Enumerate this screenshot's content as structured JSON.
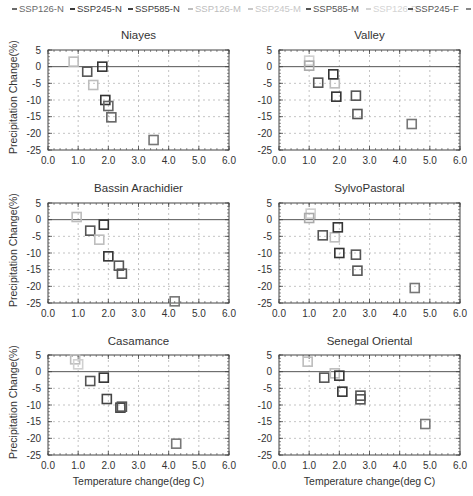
{
  "legend": [
    {
      "label": "SSP126-N",
      "color": "#6a6a6a",
      "x": 12
    },
    {
      "label": "SSP245-N",
      "color": "#3a3a3a",
      "x": 70
    },
    {
      "label": "SSP585-N",
      "color": "#404040",
      "x": 128
    },
    {
      "label": "SSP126-M",
      "color": "#bdbdbd",
      "x": 188
    },
    {
      "label": "SSP245-M",
      "color": "#c8c8c8",
      "x": 248
    },
    {
      "label": "SSP585-M",
      "color": "#555555",
      "x": 306
    },
    {
      "label": "SSP126-F",
      "color": "#d4d4d4",
      "x": 366
    },
    {
      "label": "SSP245-F",
      "color": "#555555",
      "x": 408
    },
    {
      "label": "",
      "color": "#888888",
      "x": 466
    }
  ],
  "axes": {
    "xlabel": "Temperature change(deg C)",
    "ylabel": "Precipitation Change(%)",
    "xticks": [
      "0.0",
      "1.0",
      "2.0",
      "3.0",
      "4.0",
      "5.0",
      "6.0"
    ],
    "yticks": [
      "5",
      "0",
      "-5",
      "-10",
      "-15",
      "-20",
      "-25"
    ]
  },
  "chart_data": [
    {
      "type": "scatter",
      "title": "Niayes",
      "xlabel": "",
      "ylabel": "Precipitation Change(%)",
      "xlim": [
        0,
        6
      ],
      "ylim": [
        -25,
        5
      ],
      "grid": true,
      "legend_position": "top",
      "points": [
        {
          "series": "SSP126-M",
          "x": 0.85,
          "y": 1.5,
          "color": "#bdbdbd"
        },
        {
          "series": "SSP126-N",
          "x": 1.3,
          "y": -1.5,
          "color": "#555555"
        },
        {
          "series": "SSP245-M",
          "x": 1.5,
          "y": -5.5,
          "color": "#bdbdbd"
        },
        {
          "series": "SSP245-N",
          "x": 1.8,
          "y": 0.0,
          "color": "#333333"
        },
        {
          "series": "SSP585-N",
          "x": 1.9,
          "y": -10.0,
          "color": "#333333"
        },
        {
          "series": "SSP585-M",
          "x": 2.0,
          "y": -11.8,
          "color": "#666666"
        },
        {
          "series": "SSP245-F",
          "x": 2.1,
          "y": -15.2,
          "color": "#666666"
        },
        {
          "series": "SSP585-F",
          "x": 3.5,
          "y": -22.0,
          "color": "#777777"
        }
      ]
    },
    {
      "type": "scatter",
      "title": "Valley",
      "xlabel": "",
      "ylabel": "",
      "xlim": [
        0,
        6
      ],
      "ylim": [
        -25,
        5
      ],
      "grid": true,
      "points": [
        {
          "series": "SSP126-F",
          "x": 1.0,
          "y": 1.8,
          "color": "#d0d0d0"
        },
        {
          "series": "SSP126-M",
          "x": 1.0,
          "y": 0.3,
          "color": "#aaaaaa"
        },
        {
          "series": "SSP126-N",
          "x": 1.3,
          "y": -4.8,
          "color": "#555555"
        },
        {
          "series": "SSP245-M",
          "x": 1.85,
          "y": -5.0,
          "color": "#bdbdbd"
        },
        {
          "series": "SSP245-N",
          "x": 1.8,
          "y": -2.3,
          "color": "#333333"
        },
        {
          "series": "SSP585-N",
          "x": 1.9,
          "y": -9.0,
          "color": "#333333"
        },
        {
          "series": "SSP585-M",
          "x": 2.55,
          "y": -8.7,
          "color": "#555555"
        },
        {
          "series": "SSP245-F",
          "x": 2.6,
          "y": -14.2,
          "color": "#555555"
        },
        {
          "series": "SSP585-F",
          "x": 4.4,
          "y": -17.2,
          "color": "#777777"
        }
      ]
    },
    {
      "type": "scatter",
      "title": "Bassin Arachidier",
      "xlabel": "",
      "ylabel": "Precipitation Change(%)",
      "xlim": [
        0,
        6
      ],
      "ylim": [
        -25,
        5
      ],
      "grid": true,
      "points": [
        {
          "series": "SSP126-M",
          "x": 0.95,
          "y": 0.8,
          "color": "#bdbdbd"
        },
        {
          "series": "SSP126-N",
          "x": 1.4,
          "y": -3.3,
          "color": "#555555"
        },
        {
          "series": "SSP245-M",
          "x": 1.7,
          "y": -6.0,
          "color": "#bdbdbd"
        },
        {
          "series": "SSP245-N",
          "x": 1.85,
          "y": -1.5,
          "color": "#333333"
        },
        {
          "series": "SSP585-N",
          "x": 2.0,
          "y": -11.0,
          "color": "#333333"
        },
        {
          "series": "SSP585-M",
          "x": 2.35,
          "y": -13.8,
          "color": "#555555"
        },
        {
          "series": "SSP245-F",
          "x": 2.45,
          "y": -16.2,
          "color": "#555555"
        },
        {
          "series": "SSP585-F",
          "x": 4.2,
          "y": -24.5,
          "color": "#777777"
        }
      ]
    },
    {
      "type": "scatter",
      "title": "SylvoPastoral",
      "xlabel": "",
      "ylabel": "",
      "xlim": [
        0,
        6
      ],
      "ylim": [
        -25,
        5
      ],
      "grid": true,
      "points": [
        {
          "series": "SSP126-F",
          "x": 1.05,
          "y": 1.8,
          "color": "#d0d0d0"
        },
        {
          "series": "SSP126-M",
          "x": 1.0,
          "y": 0.5,
          "color": "#aaaaaa"
        },
        {
          "series": "SSP126-N",
          "x": 1.45,
          "y": -4.7,
          "color": "#555555"
        },
        {
          "series": "SSP245-M",
          "x": 1.85,
          "y": -5.3,
          "color": "#bdbdbd"
        },
        {
          "series": "SSP245-N",
          "x": 1.95,
          "y": -2.3,
          "color": "#333333"
        },
        {
          "series": "SSP585-N",
          "x": 2.0,
          "y": -10.0,
          "color": "#333333"
        },
        {
          "series": "SSP585-M",
          "x": 2.55,
          "y": -10.5,
          "color": "#555555"
        },
        {
          "series": "SSP245-F",
          "x": 2.6,
          "y": -15.3,
          "color": "#555555"
        },
        {
          "series": "SSP585-F",
          "x": 4.5,
          "y": -20.5,
          "color": "#777777"
        }
      ]
    },
    {
      "type": "scatter",
      "title": "Casamance",
      "xlabel": "Temperature change(deg C)",
      "ylabel": "Precipitation Change(%)",
      "xlim": [
        0,
        6
      ],
      "ylim": [
        -25,
        5
      ],
      "grid": true,
      "points": [
        {
          "series": "SSP126-M",
          "x": 0.9,
          "y": 3.7,
          "color": "#bdbdbd"
        },
        {
          "series": "SSP126-F",
          "x": 1.0,
          "y": 2.2,
          "color": "#d0d0d0"
        },
        {
          "series": "SSP126-N",
          "x": 1.4,
          "y": -2.8,
          "color": "#555555"
        },
        {
          "series": "SSP245-N",
          "x": 1.85,
          "y": -1.8,
          "color": "#333333"
        },
        {
          "series": "SSP585-N",
          "x": 1.95,
          "y": -8.2,
          "color": "#444444"
        },
        {
          "series": "SSP585-M",
          "x": 2.4,
          "y": -10.8,
          "color": "#444444"
        },
        {
          "series": "SSP245-F",
          "x": 2.45,
          "y": -10.5,
          "color": "#555555"
        },
        {
          "series": "SSP585-F",
          "x": 4.25,
          "y": -21.6,
          "color": "#777777"
        }
      ]
    },
    {
      "type": "scatter",
      "title": "Senegal Oriental",
      "xlabel": "Temperature change(deg C)",
      "ylabel": "",
      "xlim": [
        0,
        6
      ],
      "ylim": [
        -25,
        5
      ],
      "grid": true,
      "points": [
        {
          "series": "SSP126-M",
          "x": 0.95,
          "y": 3.0,
          "color": "#bdbdbd"
        },
        {
          "series": "SSP126-N",
          "x": 1.5,
          "y": -1.8,
          "color": "#555555"
        },
        {
          "series": "SSP245-M",
          "x": 1.85,
          "y": -0.5,
          "color": "#bdbdbd"
        },
        {
          "series": "SSP245-N",
          "x": 2.0,
          "y": -1.2,
          "color": "#333333"
        },
        {
          "series": "SSP585-N",
          "x": 2.1,
          "y": -6.0,
          "color": "#333333"
        },
        {
          "series": "SSP585-M",
          "x": 2.7,
          "y": -7.2,
          "color": "#555555"
        },
        {
          "series": "SSP245-F",
          "x": 2.7,
          "y": -8.3,
          "color": "#555555"
        },
        {
          "series": "SSP585-F",
          "x": 4.85,
          "y": -15.7,
          "color": "#777777"
        }
      ]
    }
  ]
}
